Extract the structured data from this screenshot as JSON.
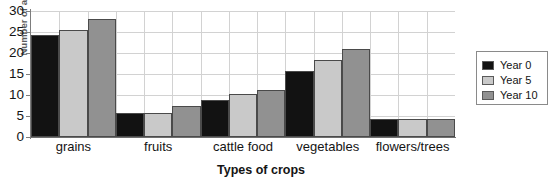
{
  "chart_data": {
    "type": "bar",
    "title": "Crop Production",
    "xlabel": "Types of crops",
    "ylabel": "Number of acres",
    "categories": [
      "grains",
      "fruits",
      "cattle food",
      "vegetables",
      "flowers/trees"
    ],
    "series": [
      {
        "name": "Year 0",
        "color": "#121212",
        "values": [
          24.2,
          5.8,
          8.7,
          15.8,
          4.3
        ]
      },
      {
        "name": "Year 5",
        "color": "#c9c9c9",
        "values": [
          25.5,
          5.8,
          10.3,
          18.3,
          4.3
        ]
      },
      {
        "name": "Year 10",
        "color": "#919191",
        "values": [
          28.0,
          7.5,
          11.3,
          21.0,
          4.3
        ]
      }
    ],
    "ylim": [
      0,
      30
    ],
    "yticks": [
      0,
      5,
      10,
      15,
      20,
      25,
      30
    ],
    "ytick_labels": [
      "0",
      "5",
      "10",
      "15",
      "20",
      "25",
      "30"
    ],
    "grid": true,
    "legend_position": "right-outside",
    "legend_entries": [
      "Year 0",
      "Year 5",
      "Year 10"
    ],
    "bar_border_color": "#4a4a4a",
    "grid_color": "#d2d2d2",
    "axis_color": "#7d7d7d"
  }
}
